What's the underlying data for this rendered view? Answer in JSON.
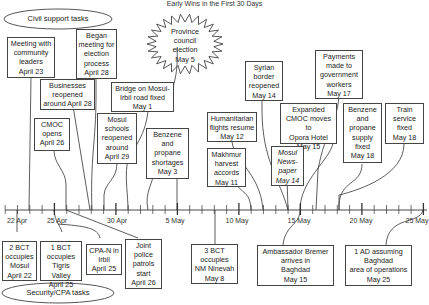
{
  "title": "Early Wins in the First 30 Days",
  "categories": {
    "civil": "Civil support tasks",
    "security": "Security/CPA tasks"
  },
  "burst": {
    "text": "Province\ncouncil\nelection\nMay 5"
  },
  "axis": {
    "start_label": "22 Apr",
    "tick_labels": [
      "22 Apr",
      "25 Apr",
      "30 Apr",
      "5 May",
      "10 May",
      "15 May",
      "20 May",
      "25 May"
    ],
    "days": 34
  },
  "civil_events": [
    {
      "text": "Meeting with\ncommunity\nleaders\nApril 23"
    },
    {
      "text": "Began\nmeeting for\nelection\nprocess\nApril 28"
    },
    {
      "text": "Businesses\nreopened\naround April 28"
    },
    {
      "text": "Bridge on Mosul-\nIrbil road fixed\nMay 1"
    },
    {
      "text": "CMOC\nopens\nApril 26"
    },
    {
      "text": "Mosul\nschools\nreopened\naround\nApril 29"
    },
    {
      "text": "Benzene\nand\npropane\nshortages\nMay 3"
    },
    {
      "text": "Syrian\nborder\nreopened\nMay 14"
    },
    {
      "text": "Humanitarian\nflights resume\nMay 12"
    },
    {
      "text": "Makhmur\nharvest\naccords\nMay 11"
    },
    {
      "text": "Payments\nmade to\ngovernment\nworkers\nMay 17"
    },
    {
      "text": "Expanded\nCMOC moves to\nOpora Hotel\nMay 15"
    },
    {
      "text": "Mosul\nNews-\npaper\nMay 14",
      "italic": true
    },
    {
      "text": "Benzene\nand\npropane\nsupply\nfixed\nMay 18"
    },
    {
      "text": "Train\nservice\nfixed\nMay 18"
    }
  ],
  "security_events": [
    {
      "text": "2 BCT\noccupies\nMosul\nApril 22"
    },
    {
      "text": "1 BCT\noccupies\nTigris Valley\nApril 25"
    },
    {
      "text": "CPA-N in\nIrbil\nApril 25"
    },
    {
      "text": "Joint\npolice\npatrols\nstart\nApril 26"
    },
    {
      "text": "3 BCT\noccupies\nNM Ninevah\nMay 8"
    },
    {
      "text": "Ambassador Bremer\narrives in\nBaghdad\nMay 15"
    },
    {
      "text": "1 AD assuming\nBaghdad\narea of operations\nMay 25"
    }
  ],
  "colors": {
    "line": "#333333",
    "box_border": "#444444",
    "background": "#ffffff"
  }
}
